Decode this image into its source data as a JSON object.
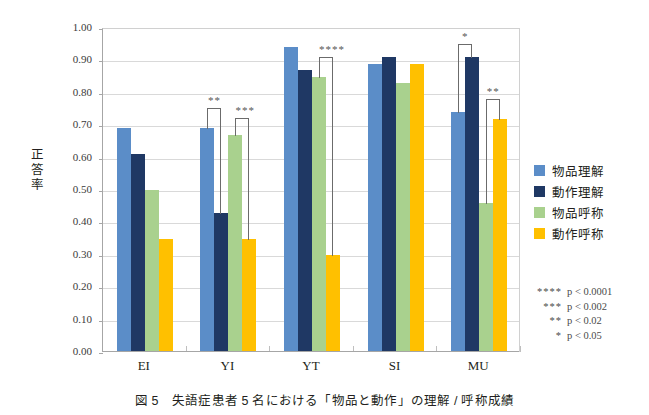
{
  "chart_data": {
    "type": "bar",
    "title": "",
    "xlabel": "",
    "ylabel": "正答率",
    "ylim": [
      0,
      1.0
    ],
    "ytick_step": 0.1,
    "grid": true,
    "legend_position": "right",
    "categories": [
      "EI",
      "YI",
      "YT",
      "SI",
      "MU"
    ],
    "ytick_labels": [
      "1.00",
      "0.90",
      "0.80",
      "0.70",
      "0.60",
      "0.50",
      "0.40",
      "0.30",
      "0.20",
      "0.10",
      "0.00"
    ],
    "series": [
      {
        "name": "物品理解",
        "color": "#5B8DC8",
        "values": [
          0.69,
          0.69,
          0.94,
          0.89,
          0.74
        ]
      },
      {
        "name": "動作理解",
        "color": "#1F3864",
        "values": [
          0.61,
          0.43,
          0.87,
          0.91,
          0.91
        ]
      },
      {
        "name": "物品呼称",
        "color": "#A9D18E",
        "values": [
          0.5,
          0.67,
          0.85,
          0.83,
          0.46
        ]
      },
      {
        "name": "動作呼称",
        "color": "#FFC000",
        "values": [
          0.35,
          0.35,
          0.3,
          0.89,
          0.72
        ]
      }
    ],
    "annotations": [
      {
        "group": "YI",
        "from_series": 0,
        "to_series": 1,
        "stars": "**",
        "top": 0.755
      },
      {
        "group": "YI",
        "from_series": 2,
        "to_series": 3,
        "stars": "***",
        "top": 0.725
      },
      {
        "group": "YT",
        "from_series": 2,
        "to_series": 3,
        "stars": "****",
        "top": 0.915
      },
      {
        "group": "MU",
        "from_series": 0,
        "to_series": 1,
        "stars": "*",
        "top": 0.955
      },
      {
        "group": "MU",
        "from_series": 2,
        "to_series": 3,
        "stars": "**",
        "top": 0.785
      }
    ]
  },
  "pkey": [
    {
      "stars": "****",
      "value": "p < 0.0001"
    },
    {
      "stars": "***",
      "value": "p < 0.002"
    },
    {
      "stars": "**",
      "value": "p < 0.02"
    },
    {
      "stars": "*",
      "value": "p < 0.05"
    }
  ],
  "caption": "図 5　失語症患者 5 名における「物品と動作」の理解 / 呼称成績"
}
